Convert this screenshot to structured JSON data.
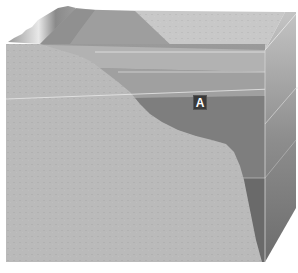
{
  "diagram": {
    "type": "ocean-block-diagram",
    "labels": [
      {
        "id": "A",
        "text": "A",
        "position": {
          "x": 200,
          "y": 102
        }
      }
    ],
    "colors": {
      "seafloor": "#b9b9b9",
      "water_surface": "#c9c9c9",
      "water_shallow": "#a8a8a8",
      "water_mid": "#8c8c8c",
      "water_deep": "#6e6e6e",
      "side_face": "#9a9a9a",
      "label_bg": "#3a3a3a",
      "label_text": "#ffffff"
    },
    "layer_lines_y": [
      52,
      72,
      96,
      178
    ]
  }
}
